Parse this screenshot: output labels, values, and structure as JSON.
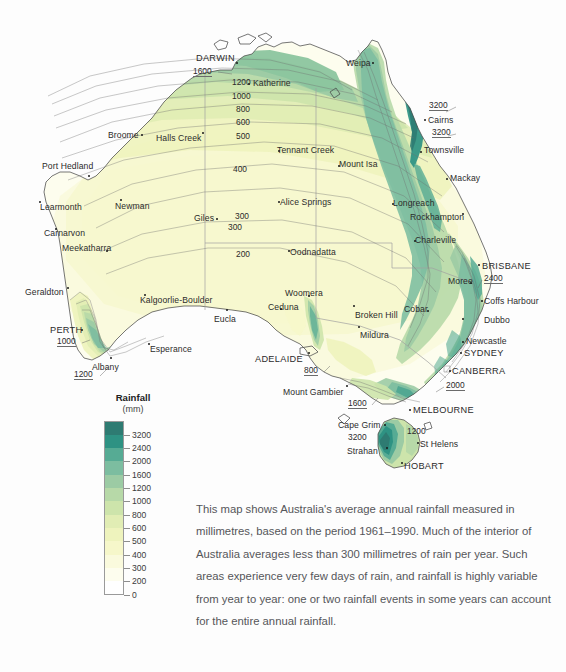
{
  "map": {
    "title_semantic": "australia-average-annual-rainfall-map",
    "cities": [
      {
        "name": "DARWIN",
        "x": 196,
        "y": 54,
        "caps": true,
        "dot_x": 236,
        "dot_y": 62
      },
      {
        "name": "Katherine",
        "x": 253,
        "y": 79,
        "caps": false,
        "dot_x": 248,
        "dot_y": 83
      },
      {
        "name": "Weipa",
        "x": 346,
        "y": 59,
        "caps": false,
        "dot_x": 372,
        "dot_y": 62
      },
      {
        "name": "Cairns",
        "x": 428,
        "y": 116,
        "caps": false,
        "dot_x": 424,
        "dot_y": 119
      },
      {
        "name": "Townsville",
        "x": 424,
        "y": 146,
        "caps": false,
        "dot_x": 420,
        "dot_y": 151
      },
      {
        "name": "Mackay",
        "x": 450,
        "y": 174,
        "caps": false,
        "dot_x": 446,
        "dot_y": 178
      },
      {
        "name": "Broome",
        "x": 108,
        "y": 131,
        "caps": false,
        "dot_x": 141,
        "dot_y": 134
      },
      {
        "name": "Halls Creek",
        "x": 156,
        "y": 134,
        "caps": false,
        "dot_x": 202,
        "dot_y": 132
      },
      {
        "name": "Port Hedland",
        "x": 42,
        "y": 162,
        "caps": false,
        "dot_x": 88,
        "dot_y": 175
      },
      {
        "name": "Learmonth",
        "x": 40,
        "y": 203,
        "caps": false,
        "dot_x": 39,
        "dot_y": 201
      },
      {
        "name": "Newman",
        "x": 115,
        "y": 202,
        "caps": false,
        "dot_x": 120,
        "dot_y": 199
      },
      {
        "name": "Carnarvon",
        "x": 44,
        "y": 229,
        "caps": false,
        "dot_x": 55,
        "dot_y": 228
      },
      {
        "name": "Meekatharra",
        "x": 62,
        "y": 244,
        "caps": false,
        "dot_x": 106,
        "dot_y": 250
      },
      {
        "name": "Giles",
        "x": 194,
        "y": 214,
        "caps": false,
        "dot_x": 216,
        "dot_y": 218
      },
      {
        "name": "Geraldton",
        "x": 25,
        "y": 288,
        "caps": false,
        "dot_x": 67,
        "dot_y": 287
      },
      {
        "name": "Kalgoorlie-Boulder",
        "x": 140,
        "y": 296,
        "caps": false,
        "dot_x": 144,
        "dot_y": 294
      },
      {
        "name": "PERTH",
        "x": 50,
        "y": 326,
        "caps": true,
        "dot_x": 81,
        "dot_y": 329
      },
      {
        "name": "Albany",
        "x": 92,
        "y": 363,
        "caps": false,
        "dot_x": 110,
        "dot_y": 357
      },
      {
        "name": "Esperance",
        "x": 150,
        "y": 345,
        "caps": false,
        "dot_x": 148,
        "dot_y": 343
      },
      {
        "name": "Eucla",
        "x": 214,
        "y": 315,
        "caps": false,
        "dot_x": 226,
        "dot_y": 309
      },
      {
        "name": "Ceduna",
        "x": 268,
        "y": 303,
        "caps": false,
        "dot_x": 280,
        "dot_y": 308
      },
      {
        "name": "Woomera",
        "x": 285,
        "y": 289,
        "caps": false,
        "dot_x": 308,
        "dot_y": 295
      },
      {
        "name": "ADELAIDE",
        "x": 255,
        "y": 355,
        "caps": true,
        "dot_x": 308,
        "dot_y": 352
      },
      {
        "name": "Mount Gambier",
        "x": 283,
        "y": 388,
        "caps": false,
        "dot_x": 346,
        "dot_y": 385
      },
      {
        "name": "Oodnadatta",
        "x": 290,
        "y": 248,
        "caps": false,
        "dot_x": 288,
        "dot_y": 250
      },
      {
        "name": "Alice Springs",
        "x": 280,
        "y": 198,
        "caps": false,
        "dot_x": 278,
        "dot_y": 201
      },
      {
        "name": "Tennant Creek",
        "x": 277,
        "y": 146,
        "caps": false,
        "dot_x": 278,
        "dot_y": 150
      },
      {
        "name": "Mount Isa",
        "x": 339,
        "y": 160,
        "caps": false,
        "dot_x": 338,
        "dot_y": 165
      },
      {
        "name": "Longreach",
        "x": 393,
        "y": 199,
        "caps": false,
        "dot_x": 392,
        "dot_y": 203
      },
      {
        "name": "Rockhampton",
        "x": 410,
        "y": 213,
        "caps": false,
        "dot_x": 462,
        "dot_y": 213
      },
      {
        "name": "Charleville",
        "x": 415,
        "y": 236,
        "caps": false,
        "dot_x": 414,
        "dot_y": 240
      },
      {
        "name": "BRISBANE",
        "x": 482,
        "y": 262,
        "caps": true,
        "dot_x": 478,
        "dot_y": 264
      },
      {
        "name": "Moree",
        "x": 448,
        "y": 277,
        "caps": false,
        "dot_x": 470,
        "dot_y": 282
      },
      {
        "name": "Coffs Harbour",
        "x": 484,
        "y": 297,
        "caps": false,
        "dot_x": 481,
        "dot_y": 300
      },
      {
        "name": "Dubbo",
        "x": 484,
        "y": 316,
        "caps": false,
        "dot_x": 462,
        "dot_y": 318
      },
      {
        "name": "Cobar",
        "x": 404,
        "y": 305,
        "caps": false,
        "dot_x": 427,
        "dot_y": 310
      },
      {
        "name": "Broken Hill",
        "x": 355,
        "y": 311,
        "caps": false,
        "dot_x": 353,
        "dot_y": 305
      },
      {
        "name": "Mildura",
        "x": 360,
        "y": 331,
        "caps": false,
        "dot_x": 358,
        "dot_y": 326
      },
      {
        "name": "Newcastle",
        "x": 466,
        "y": 337,
        "caps": false,
        "dot_x": 462,
        "dot_y": 341
      },
      {
        "name": "SYDNEY",
        "x": 464,
        "y": 349,
        "caps": true,
        "dot_x": 460,
        "dot_y": 352
      },
      {
        "name": "CANBERRA",
        "x": 452,
        "y": 367,
        "caps": true,
        "dot_x": 449,
        "dot_y": 370
      },
      {
        "name": "MELBOURNE",
        "x": 413,
        "y": 406,
        "caps": true,
        "dot_x": 409,
        "dot_y": 409
      },
      {
        "name": "Cape Grim",
        "x": 338,
        "y": 421,
        "caps": false,
        "dot_x": 384,
        "dot_y": 424
      },
      {
        "name": "Strahan",
        "x": 347,
        "y": 447,
        "caps": false,
        "dot_x": 386,
        "dot_y": 447
      },
      {
        "name": "St Helens",
        "x": 420,
        "y": 440,
        "caps": false,
        "dot_x": 417,
        "dot_y": 442
      },
      {
        "name": "HOBART",
        "x": 404,
        "y": 462,
        "caps": true,
        "dot_x": 401,
        "dot_y": 462
      }
    ],
    "contour_labels": [
      {
        "value": "1600",
        "x": 193,
        "y": 67,
        "underlined": true
      },
      {
        "value": "1200",
        "x": 232,
        "y": 78,
        "underlined": false
      },
      {
        "value": "1000",
        "x": 232,
        "y": 92,
        "underlined": false
      },
      {
        "value": "800",
        "x": 236,
        "y": 105,
        "underlined": false
      },
      {
        "value": "600",
        "x": 236,
        "y": 118,
        "underlined": false
      },
      {
        "value": "500",
        "x": 236,
        "y": 132,
        "underlined": false
      },
      {
        "value": "400",
        "x": 233,
        "y": 165,
        "underlined": false
      },
      {
        "value": "300",
        "x": 235,
        "y": 212,
        "underlined": false
      },
      {
        "value": "300",
        "x": 228,
        "y": 223,
        "underlined": false
      },
      {
        "value": "200",
        "x": 236,
        "y": 250,
        "underlined": false
      },
      {
        "value": "3200",
        "x": 429,
        "y": 101,
        "underlined": true
      },
      {
        "value": "3200",
        "x": 432,
        "y": 128,
        "underlined": true
      },
      {
        "value": "2400",
        "x": 484,
        "y": 274,
        "underlined": true
      },
      {
        "value": "2000",
        "x": 446,
        "y": 381,
        "underlined": true
      },
      {
        "value": "1000",
        "x": 57,
        "y": 337,
        "underlined": true
      },
      {
        "value": "1200",
        "x": 74,
        "y": 370,
        "underlined": true
      },
      {
        "value": "800",
        "x": 304,
        "y": 366,
        "underlined": true
      },
      {
        "value": "1600",
        "x": 348,
        "y": 399,
        "underlined": true
      },
      {
        "value": "1200",
        "x": 407,
        "y": 427,
        "underlined": false
      },
      {
        "value": "3200",
        "x": 348,
        "y": 433,
        "underlined": false
      }
    ]
  },
  "legend": {
    "title": "Rainfall",
    "unit": "(mm)",
    "values": [
      "3200",
      "2400",
      "2000",
      "1600",
      "1200",
      "1000",
      "800",
      "600",
      "500",
      "400",
      "300",
      "200",
      "0"
    ],
    "colors": [
      "#2e7b72",
      "#2e9283",
      "#56ab94",
      "#7cbda0",
      "#9ccba4",
      "#b7d9a8",
      "#cde4ab",
      "#e1edb4",
      "#eef3bd",
      "#f6f7ca",
      "#fafadd",
      "#fdfdee",
      "#ffffff"
    ]
  },
  "description": {
    "text": "This map shows Australia's average annual rainfall measured in millimetres, based on the period 1961–1990. Much of the interior of Australia averages less than 300 millimetres of rain per year. Such areas experience very few days of rain, and rainfall is highly variable from year to year: one or two rainfall events in some years can account for the entire annual rainfall."
  },
  "palette": {
    "background": "#fdfdfd",
    "deep_teal": "#2e7b72",
    "mid_green": "#7cbda0",
    "pale_yellow": "#f6f7ca",
    "coast_line": "#4a4a4a",
    "state_border": "#a8a8a8"
  }
}
